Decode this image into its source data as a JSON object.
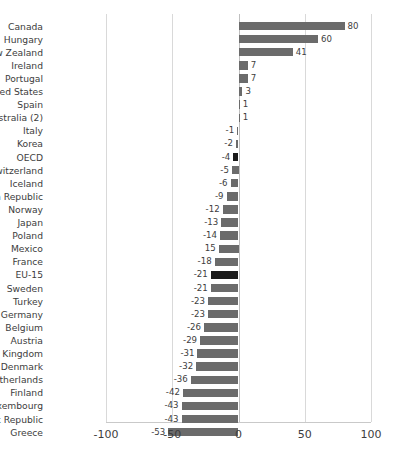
{
  "chart_data": {
    "type": "bar",
    "orientation": "horizontal",
    "title": "",
    "subtitle": "",
    "xlabel": "",
    "ylabel": "",
    "xlim": [
      -100,
      100
    ],
    "xticks": [
      -100,
      -50,
      0,
      50,
      100
    ],
    "xticklabels": [
      "-100",
      "-50",
      "0",
      "50",
      "100"
    ],
    "grid": true,
    "legend": false,
    "bar_color": "#6b6b6b",
    "highlight_color": "#1a1a1a",
    "highlighted_categories": [
      "OECD",
      "EU-15"
    ],
    "categories": [
      "Canada",
      "Hungary",
      "New Zealand",
      "Ireland",
      "Portugal",
      "United States",
      "Spain",
      "Australia (2)",
      "Italy",
      "Korea",
      "OECD",
      "Switzerland",
      "Iceland",
      "Czech Republic",
      "Norway",
      "Japan",
      "Poland",
      "Mexico",
      "France",
      "EU-15",
      "Sweden",
      "Turkey",
      "Germany",
      "Belgium",
      "Austria",
      "United Kingdom",
      "Denmark",
      "Netherlands",
      "Finland",
      "Luxembourg",
      "Slovak Republic",
      "Greece"
    ],
    "values": [
      80,
      60,
      41,
      7,
      7,
      3,
      1,
      1,
      -1,
      -2,
      -4,
      -5,
      -6,
      -9,
      -12,
      -13,
      -14,
      -15,
      -18,
      -21,
      -21,
      -23,
      -23,
      -26,
      -29,
      -31,
      -32,
      -36,
      -42,
      -43,
      -43,
      -53
    ],
    "value_labels": [
      "80",
      "60",
      "41",
      "7",
      "7",
      "3",
      "1",
      "1",
      "-1",
      "-2",
      "-4",
      "-5",
      "-6",
      "-9",
      "-12",
      "-13",
      "-14",
      "15",
      "-18",
      "-21",
      "-21",
      "-23",
      "-23",
      "-26",
      "-29",
      "-31",
      "-32",
      "-36",
      "-42",
      "-43",
      "-43",
      "-53"
    ]
  }
}
